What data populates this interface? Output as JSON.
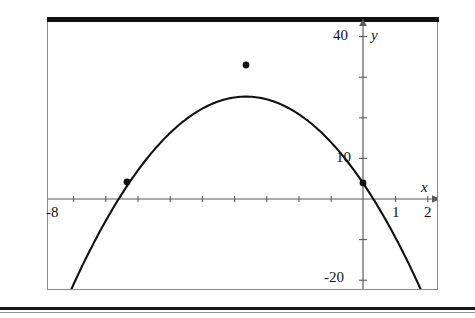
{
  "figure": {
    "frame": {
      "left": 47,
      "top": 18,
      "width": 391,
      "height": 272
    },
    "axis_color": "#5a5a5a",
    "curve_color": "#111111",
    "point_color": "#111111",
    "rule_color": "#111111"
  },
  "labels": {
    "x_axis": "x",
    "y_axis": "y",
    "x_ticks": [
      {
        "text": "-8",
        "value": -8,
        "px": 46,
        "py": 206
      },
      {
        "text": "1",
        "value": 1,
        "px": 396,
        "py": 206
      },
      {
        "text": "2",
        "value": 2,
        "px": 428,
        "py": 206
      }
    ],
    "y_ticks": [
      {
        "text": "40",
        "value": 40,
        "px": 333,
        "py": 29
      },
      {
        "text": "10",
        "value": 10,
        "px": 336,
        "py": 150
      },
      {
        "text": "-20",
        "value": -20,
        "px": 325,
        "py": 270
      }
    ]
  },
  "chart_data": {
    "type": "line",
    "title": "",
    "subtitle": "",
    "xlabel": "x",
    "ylabel": "y",
    "grid": false,
    "legend": null,
    "xlim": [
      -8.8,
      2.4
    ],
    "ylim": [
      -23.5,
      42.5
    ],
    "x_tick_step": 1,
    "x_tick_values": [
      -8,
      -7,
      -6,
      -5,
      -4,
      -3,
      -2,
      -1,
      0,
      1,
      2
    ],
    "x_tick_labeled": [
      -8,
      1,
      2
    ],
    "y_tick_values": [
      -20,
      -10,
      10,
      20,
      30,
      40
    ],
    "y_tick_labeled": [
      40,
      10,
      -20
    ],
    "function": "y = -3x^2 - 18x + 5",
    "series": [
      {
        "name": "parabola",
        "x": [
          -8.0,
          -7.5,
          -7.0,
          -6.5,
          -6.0,
          -5.5,
          -5.0,
          -4.5,
          -4.0,
          -3.5,
          -3.0,
          -2.5,
          -2.0,
          -1.5,
          -1.0,
          -0.5,
          0.0,
          0.5,
          1.0,
          1.5,
          2.0
        ],
        "y": [
          -43.0,
          -28.8,
          -16.0,
          -4.8,
          5.0,
          13.3,
          20.0,
          25.3,
          29.0,
          31.3,
          32.0,
          31.3,
          29.0,
          25.3,
          20.0,
          13.3,
          5.0,
          -4.8,
          -16.0,
          -28.8,
          -43.0
        ]
      }
    ],
    "marked_points": [
      {
        "label": "left-root-region-point",
        "x": -6.0,
        "y": 5.0,
        "px": 127,
        "py": 182
      },
      {
        "label": "vertex",
        "x": -3.0,
        "y": 32.0,
        "px": 246,
        "py": 65
      },
      {
        "label": "y-intercept",
        "x": 0.0,
        "y": 5.0,
        "px": 363,
        "py": 183
      }
    ]
  }
}
